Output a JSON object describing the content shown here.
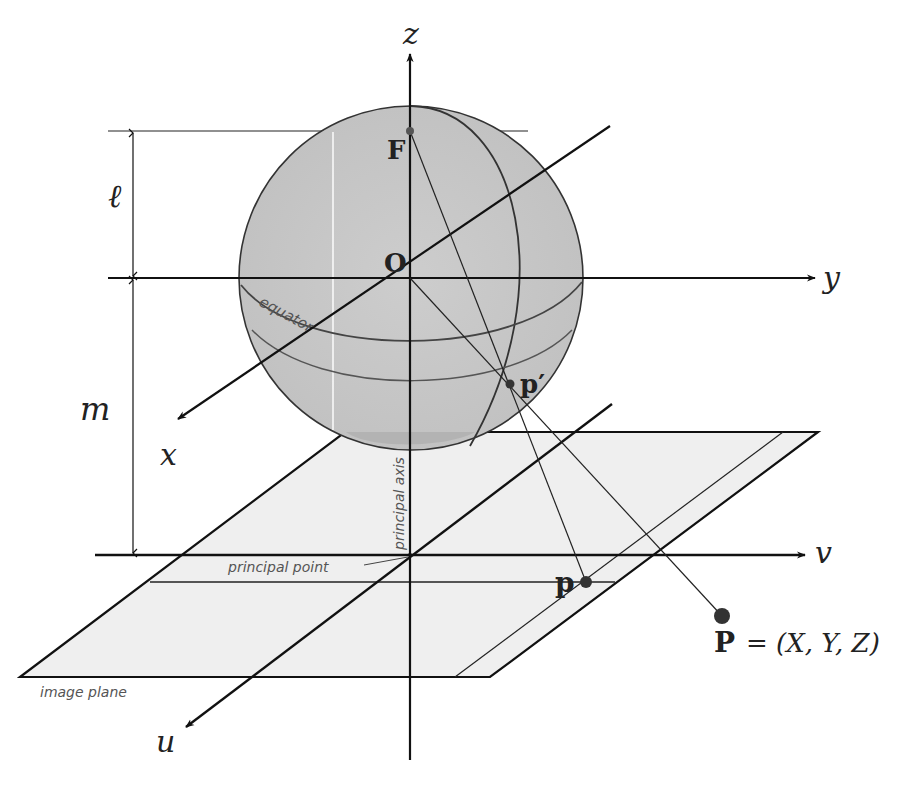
{
  "figure": {
    "colors": {
      "background": "#ffffff",
      "sphere_fill": "#c8c8c8",
      "plane_fill": "#efefef",
      "line": "#111111",
      "sphere_line": "#444444",
      "point": "#333333",
      "handwritten_label": "#555555"
    }
  },
  "axes": {
    "z": "z",
    "y": "y",
    "x": "x",
    "v": "v",
    "u": "u"
  },
  "dimensions": {
    "l": "ℓ",
    "m": "m"
  },
  "points": {
    "F": "F",
    "O": "O",
    "p_prime": "p′",
    "p": "p",
    "P_label": "P",
    "P_coords": "= (X, Y, Z)"
  },
  "annotations": {
    "equator": "equator",
    "principal_axis": "principal axis",
    "principal_point": "principal point",
    "image_plane": "image plane"
  }
}
